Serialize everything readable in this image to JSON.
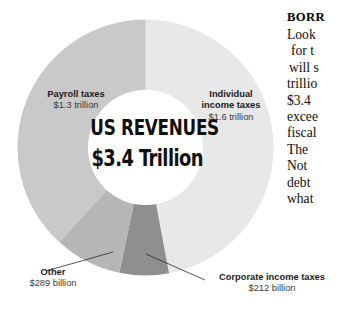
{
  "chart_data": {
    "type": "pie",
    "title": "US REVENUES",
    "subtitle": "$3.4 Trillion",
    "total_label": "$3.4 Trillion",
    "total_value": 3.4,
    "units": "trillion USD",
    "legend": "none",
    "grid": false,
    "donut": true,
    "inner_radius_ratio": 0.45,
    "start_angle_deg": 0,
    "direction": "clockwise",
    "categories": [
      "Individual income taxes",
      "Corporate income taxes",
      "Other",
      "Payroll taxes"
    ],
    "values": [
      1.6,
      0.212,
      0.289,
      1.3
    ],
    "value_labels": [
      "$1.6 trillion",
      "$212 billion",
      "$289 billion",
      "$1.3 trillion"
    ],
    "percentages": [
      47.1,
      6.2,
      8.5,
      38.2
    ],
    "colors": [
      "#e8e8e8",
      "#8f8f8f",
      "#b6b6b6",
      "#c9c9c9"
    ],
    "slices": [
      {
        "name": "Individual income taxes",
        "label_line_1": "Individual",
        "label_line_2": "income taxes",
        "value_label": "$1.6 trillion",
        "value": 1.6,
        "percent": 47.1,
        "color": "#e8e8e8",
        "start_deg": 0,
        "end_deg": 169.4
      },
      {
        "name": "Corporate income taxes",
        "label_line_1": "Corporate income taxes",
        "value_label": "$212 billion",
        "value": 0.212,
        "percent": 6.2,
        "color": "#8f8f8f",
        "start_deg": 169.4,
        "end_deg": 191.8
      },
      {
        "name": "Other",
        "label_line_1": "Other",
        "value_label": "$289 billion",
        "value": 0.289,
        "percent": 8.5,
        "color": "#b6b6b6",
        "start_deg": 191.8,
        "end_deg": 222.4
      },
      {
        "name": "Payroll taxes",
        "label_line_1": "Payroll taxes",
        "value_label": "$1.3 trillion",
        "value": 1.3,
        "percent": 38.2,
        "color": "#c9c9c9",
        "start_deg": 222.4,
        "end_deg": 360
      }
    ]
  },
  "center": {
    "title": "US REVENUES",
    "value": "$3.4 Trillion"
  },
  "labels": {
    "payroll": {
      "name": "Payroll taxes",
      "value": "$1.3 trillion"
    },
    "individual": {
      "name_line_1": "Individual",
      "name_line_2": "income taxes",
      "value": "$1.6 trillion"
    },
    "other": {
      "name": "Other",
      "value": "$289 billion"
    },
    "corporate": {
      "name": "Corporate income taxes",
      "value": "$212 billion"
    }
  },
  "article": {
    "heading": "BORR",
    "lines": [
      "Look",
      "for t",
      "will s",
      "trillio",
      "$3.4",
      "excee",
      "fiscal",
      "The",
      "Not",
      "debt",
      "what"
    ]
  }
}
